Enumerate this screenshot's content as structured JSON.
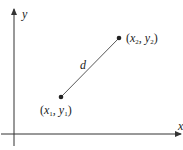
{
  "diagram": {
    "axes": {
      "x_label": "x",
      "y_label": "y"
    },
    "points": [
      {
        "label_var_x": "x",
        "label_sub_x": "1",
        "label_var_y": "y",
        "label_sub_y": "1",
        "cx": 61,
        "cy": 97
      },
      {
        "label_var_x": "x",
        "label_sub_x": "2",
        "label_var_y": "y",
        "label_sub_y": "2",
        "cx": 119,
        "cy": 38
      }
    ],
    "segment_label": "d",
    "colors": {
      "stroke": "#333333",
      "text": "#222222"
    }
  }
}
